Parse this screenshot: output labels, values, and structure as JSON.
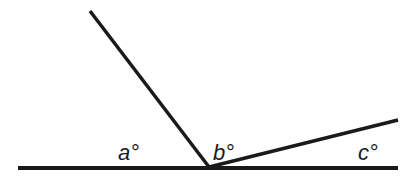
{
  "diagram": {
    "type": "angles-on-a-straight-line",
    "labels": {
      "a": "a°",
      "b": "b°",
      "c": "c°"
    },
    "line_color": "#1a1a1a"
  }
}
